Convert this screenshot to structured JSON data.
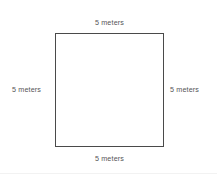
{
  "diagram": {
    "type": "square-with-side-labels",
    "shape": {
      "name": "square",
      "fill_color": "#ffffff",
      "stroke_color": "#4a4a4a"
    },
    "labels": {
      "top": "5 meters",
      "right": "5 meters",
      "bottom": "5 meters",
      "left": "5 meters"
    },
    "background_color": "#ffffff",
    "text_color": "#555555"
  }
}
